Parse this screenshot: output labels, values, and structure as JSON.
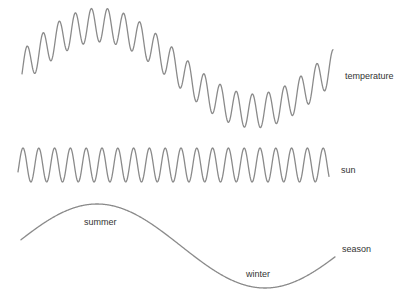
{
  "diagram": {
    "colors": {
      "line": "#8a8a8a",
      "text": "#333333",
      "background": "#ffffff"
    },
    "waves": [
      {
        "id": "temperature",
        "label": "temperature",
        "x_start": 22,
        "x_end": 333,
        "slow": {
          "midline": 68,
          "amplitude": 43,
          "period": 310,
          "peak_x": 99
        },
        "fast": {
          "amplitude": 17,
          "period": 16.1,
          "peak_x": 27
        },
        "label_pos": [
          345,
          72
        ]
      },
      {
        "id": "sun",
        "label": "sun",
        "x_start": 18,
        "x_end": 329,
        "fast": {
          "midline": 165,
          "amplitude": 17,
          "period": 15.8,
          "peak_x": 23
        },
        "label_pos": [
          341,
          166
        ]
      },
      {
        "id": "season",
        "label": "season",
        "x_start": 21,
        "x_end": 335,
        "slow": {
          "midline": 246,
          "amplitude": 42,
          "period": 336,
          "peak_x": 97
        },
        "label_pos": [
          342,
          245
        ]
      }
    ],
    "annotations": [
      {
        "text": "summer",
        "pos": [
          84,
          218
        ]
      },
      {
        "text": "winter",
        "pos": [
          246,
          270
        ]
      }
    ]
  }
}
